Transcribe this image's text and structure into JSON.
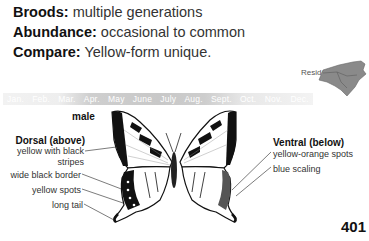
{
  "facts": [
    {
      "key": "Broods:",
      "value": "multiple generations"
    },
    {
      "key": "Abundance:",
      "value": "occasional to common"
    },
    {
      "key": "Compare:",
      "value": "Yellow-form unique."
    }
  ],
  "range_map": {
    "label": "Resident",
    "region": "north-carolina-map"
  },
  "flight_months": {
    "months": [
      "Jan.",
      "Feb.",
      "Mar.",
      "Apr.",
      "May",
      "June",
      "July",
      "Aug.",
      "Sept.",
      "Oct.",
      "Nov.",
      "Dec."
    ],
    "active": [
      "Apr.",
      "May",
      "June",
      "July",
      "Aug.",
      "Sept."
    ]
  },
  "specimen": {
    "sex": "male",
    "dorsal": {
      "heading": "Dorsal (above)",
      "labels": [
        "yellow with black stripes",
        "wide black border",
        "yellow spots",
        "long tail"
      ]
    },
    "ventral": {
      "heading": "Ventral (below)",
      "labels": [
        "yellow-orange spots",
        "blue scaling"
      ]
    }
  },
  "page_number": "401"
}
